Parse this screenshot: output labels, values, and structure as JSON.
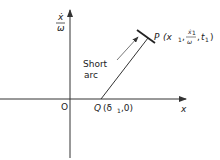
{
  "diagram": {
    "type": "phase-plane",
    "axes": {
      "x_label": "x",
      "y_label_num": "ẋ",
      "y_label_den": "ω",
      "origin_label": "O"
    },
    "points": {
      "P": {
        "name": "P",
        "coords_prefix": "(x",
        "sub1": "1",
        "frac_num": "ẋ",
        "frac_num_sub": "1",
        "frac_den": "ω",
        "t": "t",
        "t_sub": "1",
        "close": ")"
      },
      "Q": {
        "name": "Q",
        "coords": "(δ",
        "sub": "1",
        "rest": ",0)"
      }
    },
    "annotation": {
      "line1": "Short",
      "line2": "arc"
    },
    "colors": {
      "line": "#333333",
      "text": "#222222"
    }
  }
}
